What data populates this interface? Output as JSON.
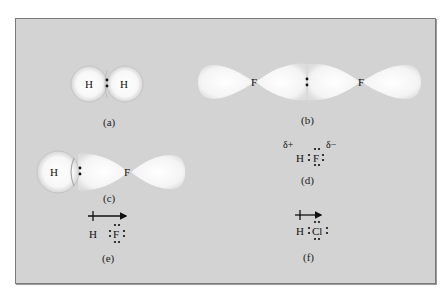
{
  "figure": {
    "background_color": "#d3d3d3",
    "border_color": "#7a7a7a",
    "panels": [
      {
        "id": "a",
        "label": "(a)",
        "description": "H2 sphere overlap",
        "atoms": [
          "H",
          "H"
        ],
        "shared_pair": ":"
      },
      {
        "id": "b",
        "label": "(b)",
        "description": "F2 p-orbital overlap",
        "atoms": [
          "F",
          "F"
        ],
        "shared_pair": ":"
      },
      {
        "id": "c",
        "label": "(c)",
        "description": "HF s-p orbital overlap",
        "atoms": [
          "H",
          "F"
        ],
        "shared_pair": ":"
      },
      {
        "id": "d",
        "label": "(d)",
        "description": "HF Lewis structure with partial charges",
        "atoms": [
          "H",
          "F"
        ],
        "partial_positive": "δ+",
        "partial_negative": "δ−"
      },
      {
        "id": "e",
        "label": "(e)",
        "description": "HF dipole arrow",
        "atoms": [
          "H",
          "F"
        ],
        "dipole_arrow": "crossed-arrow-right"
      },
      {
        "id": "f",
        "label": "(f)",
        "description": "HCl dipole arrow",
        "atoms": [
          "H",
          "Cl"
        ],
        "dipole_arrow": "crossed-arrow-right"
      }
    ]
  }
}
